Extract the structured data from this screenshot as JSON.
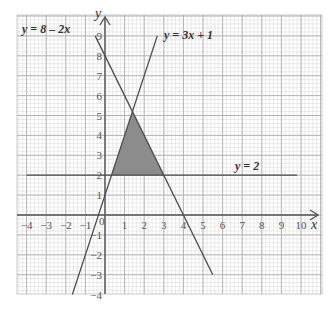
{
  "chart_data": {
    "type": "line",
    "title": "",
    "xlabel": "x",
    "ylabel": "y",
    "xlim": [
      -4,
      10
    ],
    "ylim": [
      -4,
      9
    ],
    "grid": true,
    "x_ticks": [
      "-4",
      "-3",
      "-2",
      "-1",
      "0",
      "1",
      "2",
      "3",
      "4",
      "5",
      "6",
      "7",
      "8",
      "9",
      "10"
    ],
    "y_ticks": [
      "-4",
      "-3",
      "-2",
      "-1",
      "1",
      "2",
      "3",
      "4",
      "5",
      "6",
      "7",
      "8",
      "9"
    ],
    "series": [
      {
        "name": "y = 8 - 2x",
        "x": [
          -0.5,
          5.5
        ],
        "y": [
          9,
          -3
        ]
      },
      {
        "name": "y = 3x + 1",
        "x": [
          -1.667,
          2.667
        ],
        "y": [
          -4,
          9
        ]
      },
      {
        "name": "y = 2",
        "x": [
          -4,
          9.8
        ],
        "y": [
          2,
          2
        ]
      }
    ],
    "shaded_region": {
      "description": "Triangle bounded by y = 3x + 1, y = 8 - 2x and y = 2",
      "vertices": [
        [
          0.333,
          2
        ],
        [
          3,
          2
        ],
        [
          1.4,
          5.2
        ]
      ],
      "color": "#8c8c8c"
    },
    "annotations": [
      {
        "text": "y = 8 – 2x",
        "x": -3.8,
        "y": 8.7
      },
      {
        "text": "y = 3x + 1",
        "x": 2.9,
        "y": 8.8
      },
      {
        "text": "y = 2",
        "x": 6.6,
        "y": 2.4
      }
    ]
  },
  "labels": {
    "eq1": "y = 8 – 2x",
    "eq2": "y = 3x + 1",
    "eq3": "y = 2",
    "x_axis": "x",
    "y_axis": "y",
    "origin": "0"
  }
}
